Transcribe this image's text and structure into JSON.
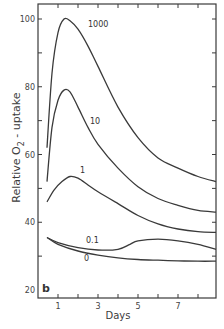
{
  "chart_data": {
    "type": "line",
    "title": "",
    "panel_label": "b",
    "xlabel": "Days",
    "ylabel": "Relative O2 - uptake",
    "ylabel_parts": [
      "Relative O",
      "2",
      " - uptake"
    ],
    "xlim": [
      0,
      8.9
    ],
    "ylim": [
      20,
      104
    ],
    "x_ticks": [
      1,
      2,
      3,
      4,
      5,
      6,
      7,
      8
    ],
    "x_tick_labels": [
      "1",
      "3",
      "5",
      "7"
    ],
    "x_tick_label_values": [
      1,
      3,
      5,
      7
    ],
    "y_ticks": [
      20,
      30,
      40,
      50,
      60,
      70,
      80,
      90,
      100
    ],
    "y_tick_labels": [
      "20",
      "40",
      "60",
      "80",
      "100"
    ],
    "y_tick_label_values": [
      20,
      40,
      60,
      80,
      100
    ],
    "grid": false,
    "legend": "inline curve labels",
    "series": [
      {
        "name": "1000",
        "label_pos": [
          2.5,
          97.5
        ],
        "x": [
          0.45,
          0.7,
          1.0,
          1.3,
          1.6,
          2.0,
          2.5,
          3.0,
          4.0,
          5.0,
          6.0,
          7.0,
          8.0,
          8.9
        ],
        "y": [
          62,
          84,
          96,
          100,
          99.5,
          97,
          92,
          86,
          74,
          65,
          59,
          56,
          53.5,
          52
        ]
      },
      {
        "name": "10",
        "label_pos": [
          2.6,
          69
        ],
        "x": [
          0.45,
          0.7,
          1.0,
          1.3,
          1.6,
          2.0,
          2.5,
          3.0,
          4.0,
          5.0,
          6.0,
          7.0,
          8.0,
          8.9
        ],
        "y": [
          52,
          68,
          76,
          79,
          78.5,
          74,
          68,
          63,
          56,
          50.5,
          47,
          45,
          43.5,
          43
        ]
      },
      {
        "name": "1",
        "label_pos": [
          2.1,
          54.5
        ],
        "x": [
          0.45,
          0.8,
          1.2,
          1.6,
          2.0,
          2.5,
          3.0,
          4.0,
          5.0,
          6.0,
          7.0,
          8.0,
          8.9
        ],
        "y": [
          46,
          49.5,
          52,
          53.5,
          53,
          51,
          49,
          45.5,
          42,
          39.5,
          38,
          37.2,
          37
        ]
      },
      {
        "name": "0.1",
        "label_pos": [
          2.4,
          34
        ],
        "x": [
          0.45,
          1.0,
          2.0,
          3.0,
          4.0,
          4.6,
          5.0,
          6.0,
          7.0,
          8.0,
          8.9
        ],
        "y": [
          35.5,
          34,
          32.5,
          31.8,
          32,
          33.5,
          34.5,
          35,
          34.5,
          33.5,
          32
        ]
      },
      {
        "name": "0",
        "label_pos": [
          2.3,
          28.5
        ],
        "x": [
          0.45,
          1.0,
          2.0,
          3.0,
          4.0,
          5.0,
          6.0,
          7.0,
          8.0,
          8.9
        ],
        "y": [
          35.5,
          33.5,
          31.5,
          30.3,
          29.5,
          29,
          28.8,
          28.6,
          28.5,
          28.5
        ]
      }
    ]
  }
}
